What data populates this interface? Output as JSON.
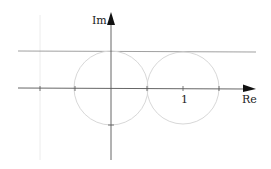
{
  "diagram": {
    "axis_labels": {
      "imaginary": "Im",
      "real": "Re"
    },
    "tick_label_one": "1",
    "colors": {
      "axis": "#555555",
      "upper_line": "#888888",
      "circle": "#d8d8d8",
      "faint_vertical": "#ececec",
      "text": "#222222"
    },
    "elements": {
      "circle_left": {
        "center_re": 0,
        "center_im": 0,
        "radius": 0.5
      },
      "circle_right": {
        "center_re": 1,
        "center_im": 0,
        "radius": 0.5
      },
      "horizontal_line_im": 0.5,
      "real_axis_ticks": [
        -1,
        -0.5,
        0,
        0.5,
        1,
        1.5
      ],
      "imag_axis_ticks": [
        -0.5
      ]
    }
  }
}
